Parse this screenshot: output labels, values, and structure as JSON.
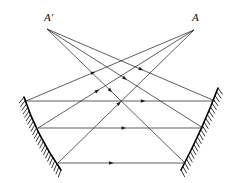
{
  "figure": {
    "domain": "Diagram",
    "title": "",
    "width": 240,
    "height": 183,
    "background_color": "#ffffff",
    "stroke_color": "#1a1a1a",
    "mirror_color": "#000000",
    "ray_stroke_width": 0.7,
    "mirror_stroke_width": 1.6
  },
  "labels": [
    {
      "id": "a-prime",
      "text": "A′",
      "x": 44,
      "y": 12,
      "style": "italic-serif"
    },
    {
      "id": "a",
      "text": "A",
      "x": 192,
      "y": 12,
      "style": "italic-serif"
    }
  ],
  "points": {
    "A_prime": {
      "x": 47,
      "y": 29
    },
    "A": {
      "x": 194,
      "y": 30
    }
  },
  "mirrors": [
    {
      "id": "left-mirror",
      "name": "left-concave-mirror",
      "path": "M 24 97 Q 36 134 61 170",
      "hatch_side": "left",
      "hatch_count": 22,
      "hatch_length": 8
    },
    {
      "id": "right-mirror",
      "name": "right-concave-mirror",
      "path": "M 218 88 Q 203 128 181 170",
      "hatch_side": "right",
      "hatch_count": 22,
      "hatch_length": 8
    }
  ],
  "horizontal_rays": [
    {
      "id": "h1",
      "x1": 26,
      "y1": 101,
      "x2": 215,
      "y2": 101,
      "arrow_at": 0.62,
      "arrow_dir": "right"
    },
    {
      "id": "h2",
      "x1": 38,
      "y1": 128,
      "x2": 203,
      "y2": 128,
      "arrow_at": 0.52,
      "arrow_dir": "right"
    },
    {
      "id": "h3",
      "x1": 58,
      "y1": 163,
      "x2": 185,
      "y2": 163,
      "arrow_at": 0.42,
      "arrow_dir": "right"
    }
  ],
  "diagonal_rays": [
    {
      "id": "d1",
      "from": "A",
      "x1": 194,
      "y1": 30,
      "x2": 26,
      "y2": 101,
      "arrow_at": 0.6,
      "arrow_dir": "toward-source"
    },
    {
      "id": "d2",
      "from": "A",
      "x1": 194,
      "y1": 30,
      "x2": 38,
      "y2": 128,
      "arrow_at": 0.62,
      "arrow_dir": "toward-source"
    },
    {
      "id": "d3",
      "from": "A",
      "x1": 194,
      "y1": 30,
      "x2": 58,
      "y2": 163,
      "arrow_at": 0.55,
      "arrow_dir": "toward-source"
    },
    {
      "id": "d4",
      "from": "A_prime",
      "x1": 47,
      "y1": 29,
      "x2": 215,
      "y2": 101,
      "arrow_at": 0.56,
      "arrow_dir": "toward-target"
    },
    {
      "id": "d5",
      "from": "A_prime",
      "x1": 47,
      "y1": 29,
      "x2": 203,
      "y2": 128,
      "arrow_at": 0.5,
      "arrow_dir": "toward-target"
    },
    {
      "id": "d6",
      "from": "A_prime",
      "x1": 47,
      "y1": 29,
      "x2": 185,
      "y2": 163,
      "arrow_at": 0.46,
      "arrow_dir": "toward-target"
    }
  ]
}
